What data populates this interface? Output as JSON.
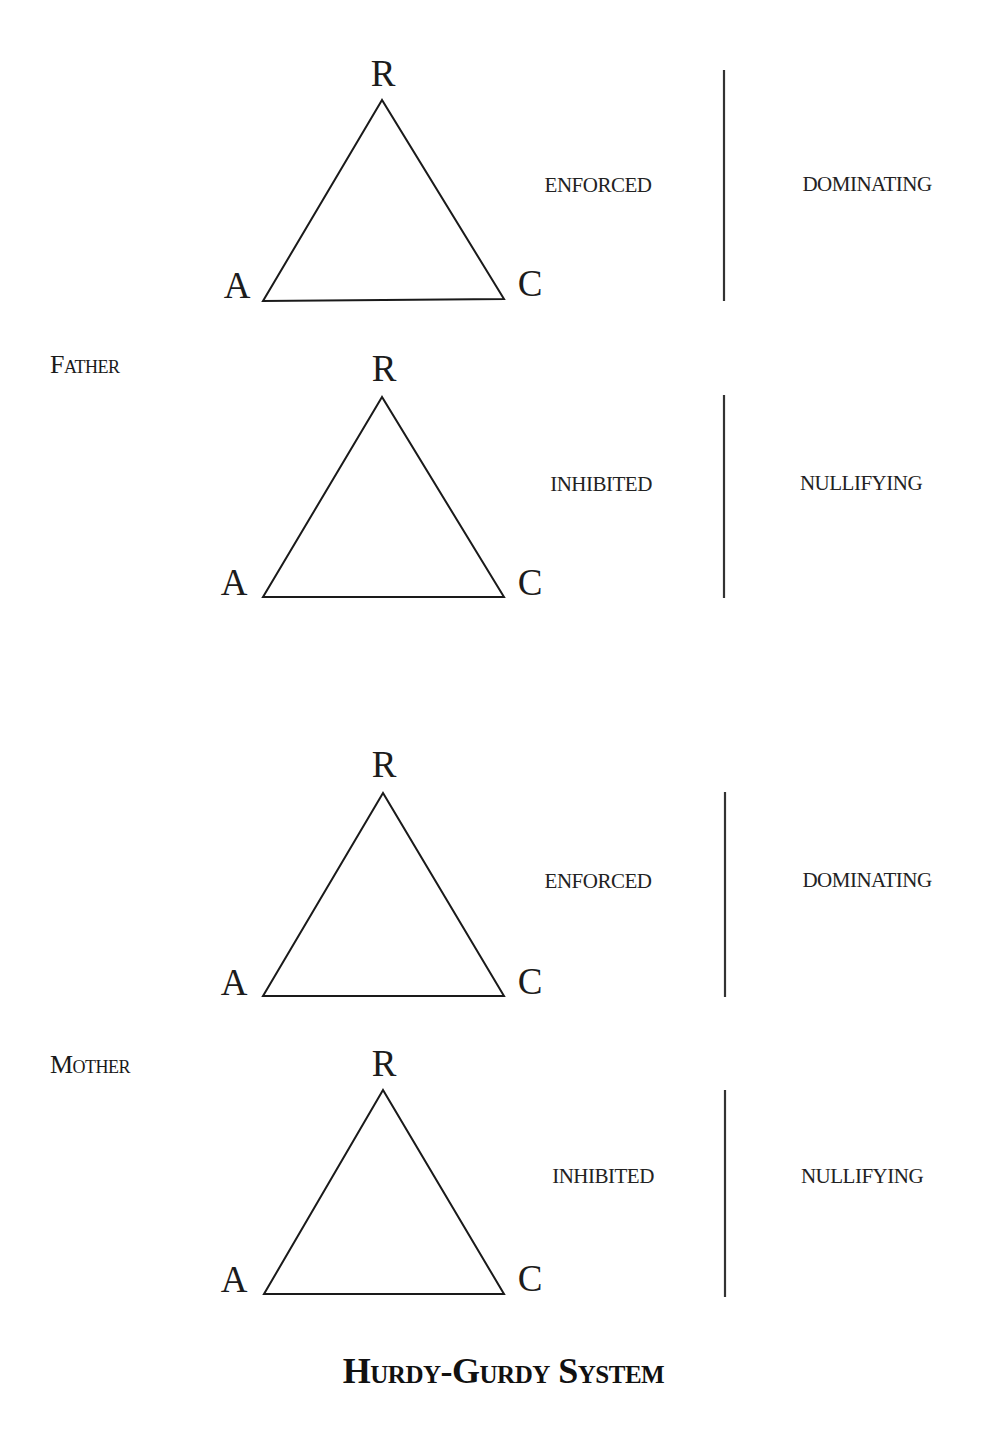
{
  "title": "Hurdy-Gurdy System",
  "groups": [
    {
      "parent_label": "Father",
      "diagrams": [
        {
          "vertices": {
            "top": "R",
            "left": "A",
            "right": "C"
          },
          "left_state": "ENFORCED",
          "right_state": "DOMINATING"
        },
        {
          "vertices": {
            "top": "R",
            "left": "A",
            "right": "C"
          },
          "left_state": "INHIBITED",
          "right_state": "NULLIFYING"
        }
      ]
    },
    {
      "parent_label": "Mother",
      "diagrams": [
        {
          "vertices": {
            "top": "R",
            "left": "A",
            "right": "C"
          },
          "left_state": "ENFORCED",
          "right_state": "DOMINATING"
        },
        {
          "vertices": {
            "top": "R",
            "left": "A",
            "right": "C"
          },
          "left_state": "INHIBITED",
          "right_state": "NULLIFYING"
        }
      ]
    }
  ],
  "colors": {
    "stroke": "#1a1a1a",
    "divider": "#333333",
    "background": "#ffffff"
  }
}
